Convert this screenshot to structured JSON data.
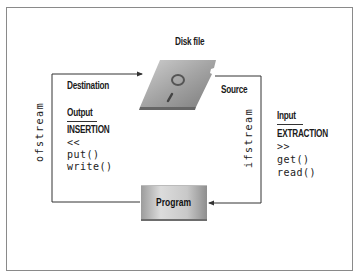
{
  "diagram": {
    "disk_label": "Disk file",
    "program_label": "Program",
    "left_path": {
      "stream_label": "ofstream",
      "direction_label": "Destination",
      "heading": "Output",
      "operation": "INSERTION",
      "members": [
        "<<",
        "put()",
        "write()"
      ]
    },
    "right_path": {
      "stream_label": "ifstream",
      "direction_label": "Source",
      "heading": "Input",
      "operation": "EXTRACTION",
      "members": [
        ">>",
        "get()",
        "read()"
      ]
    },
    "colors": {
      "frame": "#8a8a8a",
      "line": "#333333",
      "shape_gray": "#a8a8a8"
    }
  }
}
